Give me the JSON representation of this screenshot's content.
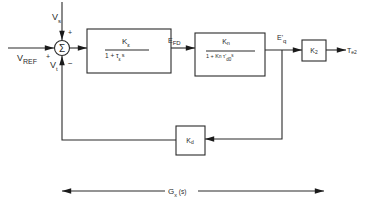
{
  "diagram": {
    "type": "block-diagram",
    "summing_junction": {
      "symbol": "Σ",
      "inputs": [
        {
          "label": "V",
          "sub": "s",
          "sign": "+"
        },
        {
          "label": "V",
          "sub": "REF",
          "sign": "+"
        },
        {
          "label": "V",
          "sub": "t",
          "sign": "−"
        }
      ]
    },
    "blocks": {
      "exciter": {
        "num": "K",
        "num_sub": "ε",
        "den": "1 + τ",
        "den_sub": "ε",
        "den_tail": "s"
      },
      "field": {
        "num": "K",
        "num_sub": "n",
        "den_pre": "1 + K",
        "den_sub1": "n",
        "den_mid": " τ'",
        "den_sub2": "d0",
        "den_tail": "s"
      },
      "gain2": {
        "label": "K",
        "sub": "2"
      },
      "feedback": {
        "label": "K",
        "sub": "d"
      }
    },
    "signals": {
      "efd": {
        "label": "E",
        "sub": "FD"
      },
      "eq": {
        "label": "E'",
        "sub": "q"
      },
      "te": {
        "label": "T",
        "sub": "e2"
      }
    },
    "span": {
      "label": "G",
      "sub": "x",
      "tail": " (s)"
    }
  }
}
